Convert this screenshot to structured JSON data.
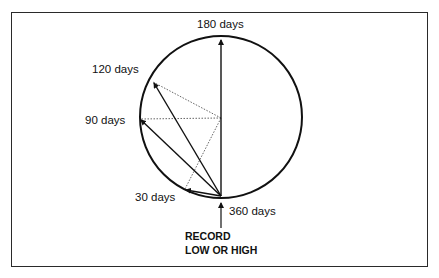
{
  "diagram": {
    "type": "circular-cycle",
    "labels": {
      "d180": "180 days",
      "d120": "120 days",
      "d90": "90 days",
      "d30": "30 days",
      "d360": "360 days",
      "record_line1": "RECORD",
      "record_line2": "LOW OR HIGH"
    },
    "circle": {
      "cx": 221,
      "cy": 117,
      "r": 81
    },
    "points": [
      {
        "name": "360 days",
        "x": 221,
        "y": 197
      },
      {
        "name": "180 days",
        "x": 221,
        "y": 37
      },
      {
        "name": "120 days",
        "x": 153,
        "y": 82
      },
      {
        "name": "90 days",
        "x": 140,
        "y": 119
      },
      {
        "name": "30 days",
        "x": 185,
        "y": 189
      }
    ],
    "colors": {
      "stroke": "#111111",
      "dotted": "#555555",
      "frame": "#2a2a2a"
    }
  }
}
